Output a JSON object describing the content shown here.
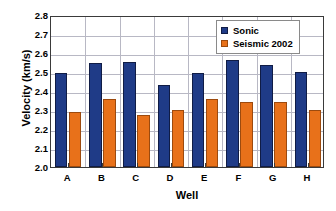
{
  "chart_data": {
    "type": "bar",
    "title": "",
    "xlabel": "Well",
    "ylabel": "Velocity (km/s)",
    "categories": [
      "A",
      "B",
      "C",
      "D",
      "E",
      "F",
      "G",
      "H"
    ],
    "series": [
      {
        "name": "Sonic",
        "color": "#1f3b87",
        "values": [
          2.495,
          2.545,
          2.553,
          2.433,
          2.495,
          2.565,
          2.537,
          2.501
        ]
      },
      {
        "name": "Seismic 2002",
        "color": "#e8711a",
        "values": [
          2.29,
          2.356,
          2.273,
          2.301,
          2.356,
          2.342,
          2.344,
          2.301
        ]
      }
    ],
    "ylim": [
      2.0,
      2.8
    ],
    "ytick_values": [
      2.0,
      2.1,
      2.2,
      2.3,
      2.4,
      2.5,
      2.6,
      2.7,
      2.8
    ],
    "ytick_labels": [
      "2.0",
      "2.1",
      "2.2",
      "2.3",
      "2.4",
      "2.5",
      "2.6",
      "2.7",
      "2.8"
    ],
    "grid": true,
    "grid_color": "#b8b8c4",
    "legend_position": "top-right",
    "axis_color": "#3a3a3a",
    "background": "#ffffff"
  }
}
